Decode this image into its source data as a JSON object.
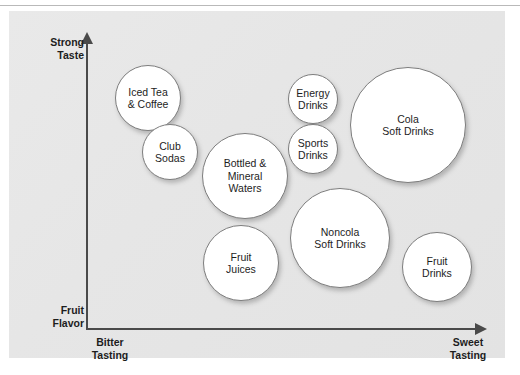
{
  "figure": {
    "type": "perceptual-positioning-map",
    "panel_background": "#e6e6e6",
    "bubble_fill": "#ffffff",
    "bubble_stroke": "#7d7d7d",
    "axis_color": "#4a4a4a"
  },
  "axes": {
    "y_top_label": "Strong\nTaste",
    "y_bottom_label": "Fruit\nFlavor",
    "x_left_label": "Bitter\nTasting",
    "x_right_label": "Sweet\nTasting"
  },
  "chart_data": {
    "type": "scatter",
    "title": "",
    "xlabel": "Bitter Tasting → Sweet Tasting",
    "ylabel": "Fruit Flavor → Strong Taste",
    "xlim": [
      0,
      100
    ],
    "ylim": [
      0,
      100
    ],
    "grid": false,
    "legend": "none",
    "x_axis_ticks": [
      "Bitter Tasting",
      "Sweet Tasting"
    ],
    "y_axis_ticks": [
      "Fruit Flavor",
      "Strong Taste"
    ],
    "points": [
      {
        "label": "Iced Tea\n& Coffee",
        "name": "Iced Tea & Coffee",
        "x": 18,
        "y": 77,
        "size": 33,
        "cx": 148,
        "cy": 98,
        "r": 33
      },
      {
        "label": "Club\nSodas",
        "name": "Club Sodas",
        "x": 24,
        "y": 58,
        "size": 28,
        "cx": 170,
        "cy": 152,
        "r": 28
      },
      {
        "label": "Bottled &\nMineral\nWaters",
        "name": "Bottled & Mineral Waters",
        "x": 43,
        "y": 49,
        "size": 43,
        "cx": 245,
        "cy": 176,
        "r": 43
      },
      {
        "label": "Energy\nDrinks",
        "name": "Energy Drinks",
        "x": 60,
        "y": 76,
        "size": 25,
        "cx": 313,
        "cy": 99,
        "r": 25
      },
      {
        "label": "Sports\nDrinks",
        "name": "Sports Drinks",
        "x": 60,
        "y": 59,
        "size": 25,
        "cx": 313,
        "cy": 149,
        "r": 25
      },
      {
        "label": "Cola\nSoft Drinks",
        "name": "Cola Soft Drinks",
        "x": 85,
        "y": 67,
        "size": 58,
        "cx": 408,
        "cy": 125,
        "r": 58
      },
      {
        "label": "Noncola\nSoft Drinks",
        "name": "Noncola Soft Drinks",
        "x": 67,
        "y": 28,
        "size": 50,
        "cx": 340,
        "cy": 238,
        "r": 50
      },
      {
        "label": "Fruit\nJuices",
        "name": "Fruit Juices",
        "x": 42,
        "y": 19,
        "size": 38,
        "cx": 241,
        "cy": 263,
        "r": 38
      },
      {
        "label": "Fruit\nDrinks",
        "name": "Fruit Drinks",
        "x": 92,
        "y": 18,
        "size": 35,
        "cx": 437,
        "cy": 267,
        "r": 35
      }
    ]
  }
}
